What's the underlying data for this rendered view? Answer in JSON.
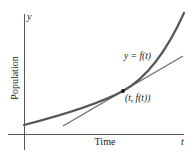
{
  "diagram": {
    "type": "function-with-tangent",
    "axes": {
      "x_label": "t",
      "y_label": "y",
      "x_title": "Time",
      "y_title": "Population"
    },
    "curve": {
      "label": "y = f(t)",
      "color": "#555555"
    },
    "tangent": {
      "color": "#666666"
    },
    "point": {
      "label": "(t, f(t))",
      "color": "#111111"
    }
  }
}
